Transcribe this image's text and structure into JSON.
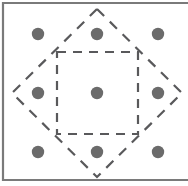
{
  "figure": {
    "width": 188,
    "height": 186,
    "background_color": "#ffffff"
  },
  "frame": {
    "name": "panel-border",
    "color": "#7a7a7a",
    "stroke_width": 2.2,
    "left_x": 3,
    "top_y": 3,
    "bottom_y": 180,
    "right_open": true
  },
  "chart_data": {
    "type": "scatter",
    "xlabel": "",
    "ylabel": "",
    "xlim": [
      0,
      188
    ],
    "ylim": [
      0,
      186
    ],
    "grid": false,
    "legend": null,
    "lattice": {
      "name": "lattice-points",
      "columns_x": [
        38,
        97,
        158
      ],
      "rows_y": [
        34,
        93,
        152
      ],
      "spacing": 59,
      "point_radius": 6.2,
      "point_color": "#6b6b6b",
      "count": 9,
      "points": [
        {
          "id": "p-top-left",
          "x": 38,
          "y": 34
        },
        {
          "id": "p-top-center",
          "x": 97,
          "y": 34
        },
        {
          "id": "p-top-right",
          "x": 158,
          "y": 34
        },
        {
          "id": "p-middle-left",
          "x": 38,
          "y": 93
        },
        {
          "id": "p-center",
          "x": 97,
          "y": 93
        },
        {
          "id": "p-middle-right",
          "x": 158,
          "y": 93
        },
        {
          "id": "p-bottom-left",
          "x": 38,
          "y": 152
        },
        {
          "id": "p-bottom-center",
          "x": 97,
          "y": 152
        },
        {
          "id": "p-bottom-right",
          "x": 158,
          "y": 152
        }
      ]
    },
    "shapes": [
      {
        "id": "inner-square",
        "name": "dashed-inner-square",
        "kind": "square",
        "orientation": "axis-aligned",
        "points": "57,52 138,52 138,134 57,134",
        "left": 57,
        "top": 52,
        "right": 138,
        "bottom": 134,
        "side_length": 81,
        "stroke_color": "#59595b",
        "stroke_width": 2.2,
        "dash_pattern": "9 7",
        "fill": "none"
      },
      {
        "id": "outer-diamond",
        "name": "dashed-outer-diamond",
        "kind": "square",
        "orientation": "rotated-45",
        "points": "97,9 182,93 97,177 12,93",
        "vertices": [
          {
            "id": "v-top",
            "x": 97,
            "y": 9
          },
          {
            "id": "v-right",
            "x": 182,
            "y": 93
          },
          {
            "id": "v-bottom",
            "x": 97,
            "y": 177
          },
          {
            "id": "v-left",
            "x": 12,
            "y": 93
          }
        ],
        "diagonal": 168,
        "stroke_color": "#59595b",
        "stroke_width": 2.2,
        "dash_pattern": "10 8",
        "fill": "none"
      }
    ]
  }
}
